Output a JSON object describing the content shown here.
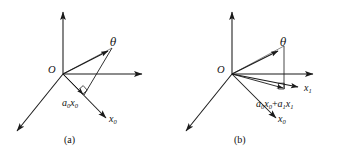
{
  "figure": {
    "background_color": "#ffffff",
    "line_color": "#1a1a1a"
  },
  "panels": [
    {
      "id": "a",
      "caption": "(a)",
      "origin_label": "O",
      "labels": {
        "theta": "θ",
        "axis_x0": "x",
        "axis_x0_sub": "0",
        "projection": "a",
        "projection_sub1": "0",
        "projection_mid": "x",
        "projection_sub2": "0"
      },
      "projection_text": "a0x0",
      "right_angle_marker": true,
      "arrows": [
        "vertical-up-axis",
        "horizontal-right-axis",
        "diagonal-down-left-axis",
        "diagonal-down-right-x0-axis",
        "theta-vector",
        "projection-vector"
      ]
    },
    {
      "id": "b",
      "caption": "(b)",
      "origin_label": "O",
      "labels": {
        "theta": "θ",
        "axis_x1": "x",
        "axis_x1_sub": "1",
        "axis_x0": "x",
        "axis_x0_sub": "0",
        "projection": "a",
        "projection_sub1": "0",
        "projection_mid": "x",
        "projection_sub2": "0",
        "projection_plus": "+",
        "projection_second": "a",
        "projection_sub3": "1",
        "projection_mid2": "x",
        "projection_sub4": "1"
      },
      "projection_text": "a0x0+a1x1",
      "right_angle_marker": true,
      "arrows": [
        "vertical-up-axis",
        "horizontal-right-axis",
        "diagonal-down-left-axis",
        "diagonal-down-right-x0-axis",
        "x1-axis",
        "theta-vector",
        "projection-vector"
      ]
    }
  ]
}
